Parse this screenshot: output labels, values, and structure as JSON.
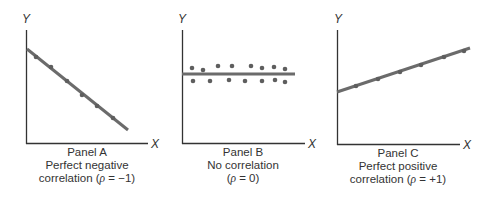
{
  "colors": {
    "axis": "#333333",
    "line": "#6b6b6b",
    "point": "#5e5e5e",
    "text": "#333333"
  },
  "panels": [
    {
      "id": "A",
      "title": "Panel A",
      "subtitle": "Perfect negative",
      "caption_line3_prefix": "correlation (",
      "rho_symbol": "ρ",
      "caption_line3_suffix": " = −1)",
      "x_label": "X",
      "y_label": "Y"
    },
    {
      "id": "B",
      "title": "Panel B",
      "subtitle": "No correlation",
      "caption_line3_prefix": "(",
      "rho_symbol": "ρ",
      "caption_line3_suffix": " = 0)",
      "x_label": "X",
      "y_label": "Y"
    },
    {
      "id": "C",
      "title": "Panel C",
      "subtitle": "Perfect positive",
      "caption_line3_prefix": "correlation (",
      "rho_symbol": "ρ",
      "caption_line3_suffix": " = +1)",
      "x_label": "X",
      "y_label": "Y"
    }
  ],
  "chart_data": [
    {
      "type": "scatter",
      "title": "Panel A",
      "subtitle": "Perfect negative correlation (ρ = −1)",
      "xlabel": "X",
      "ylabel": "Y",
      "correlation": -1,
      "points_px": [
        [
          36,
          57
        ],
        [
          51,
          67
        ],
        [
          67,
          81
        ],
        [
          82,
          95
        ],
        [
          97,
          106
        ],
        [
          113,
          118
        ]
      ],
      "fit_line_px": [
        [
          27,
          49
        ],
        [
          128,
          130
        ]
      ],
      "grid": false
    },
    {
      "type": "scatter",
      "title": "Panel B",
      "subtitle": "No correlation (ρ = 0)",
      "xlabel": "X",
      "ylabel": "Y",
      "correlation": 0,
      "points_px": [
        [
          192,
          68
        ],
        [
          203,
          70
        ],
        [
          218,
          66
        ],
        [
          232,
          66
        ],
        [
          251,
          66
        ],
        [
          262,
          68
        ],
        [
          274,
          67
        ],
        [
          285,
          69
        ],
        [
          193,
          81
        ],
        [
          210,
          81
        ],
        [
          229,
          80
        ],
        [
          245,
          81
        ],
        [
          262,
          81
        ],
        [
          275,
          80
        ],
        [
          285,
          82
        ]
      ],
      "fit_line_px": [
        [
          182,
          74
        ],
        [
          295,
          74
        ]
      ],
      "grid": false
    },
    {
      "type": "scatter",
      "title": "Panel C",
      "subtitle": "Perfect positive correlation (ρ = +1)",
      "xlabel": "X",
      "ylabel": "Y",
      "correlation": 1,
      "points_px": [
        [
          356,
          86
        ],
        [
          378,
          79
        ],
        [
          400,
          72
        ],
        [
          421,
          65
        ],
        [
          444,
          57
        ],
        [
          464,
          51
        ]
      ],
      "fit_line_px": [
        [
          337,
          92
        ],
        [
          470,
          48
        ]
      ],
      "grid": false
    }
  ]
}
